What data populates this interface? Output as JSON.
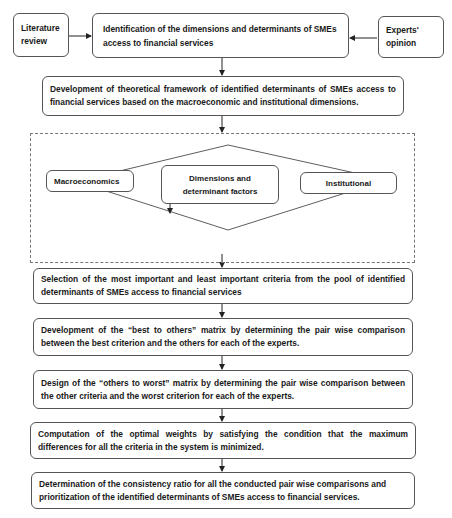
{
  "top_row": {
    "literature_review": "Literature review",
    "identification": "Identification of the dimensions and determinants of SMEs access to financial services",
    "experts_opinion": "Experts' opinion"
  },
  "framework": "Development of theoretical framework of identified determinants of SMEs access to financial services based on the macroeconomic and institutional dimensions.",
  "dimensions_panel": {
    "left": "Macroeconomics",
    "center": "Dimensions and determinant factors",
    "right": "Institutional"
  },
  "steps": [
    "Selection of the most important and least important criteria from the pool of identified determinants of SMEs access to financial services",
    "Development of the “best to others” matrix by determining the pair wise comparison between the best criterion and the others for each of the experts.",
    "Design of the “others to worst” matrix by determining the pair wise comparison between the other criteria and the worst criterion for each of the experts.",
    "Computation of the optimal weights by satisfying the condition that the maximum differences for all the criteria in the system is minimized.",
    "Determination of the consistency ratio for all the conducted pair wise comparisons and prioritization of the identified determinants of SMEs access to financial services."
  ]
}
